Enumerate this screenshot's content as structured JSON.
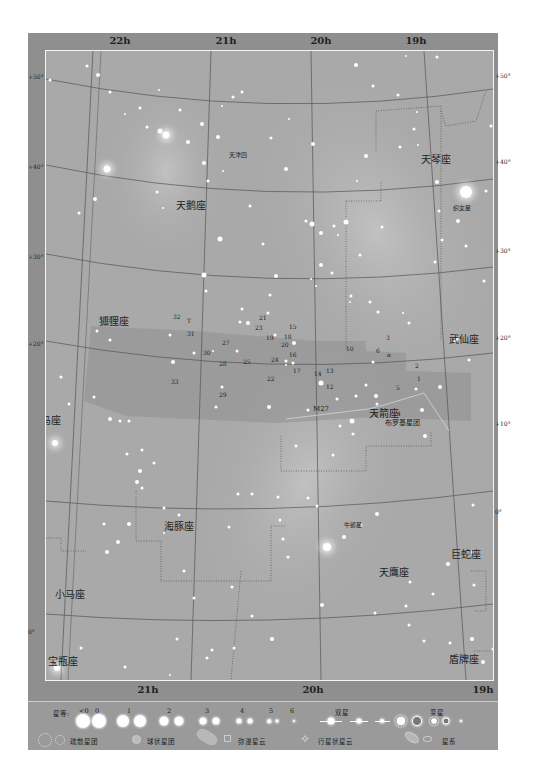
{
  "page_header": "",
  "chart": {
    "ra_labels_top": [
      {
        "label": "22h",
        "x": 92
      },
      {
        "label": "21h",
        "x": 198
      },
      {
        "label": "20h",
        "x": 293
      },
      {
        "label": "19h",
        "x": 388
      }
    ],
    "ra_labels_bottom": [
      {
        "label": "21h",
        "x": 120
      },
      {
        "label": "20h",
        "x": 285
      },
      {
        "label": "19h",
        "x": 455
      }
    ],
    "dec_labels_left": [
      {
        "label": "+50°",
        "y": 23
      },
      {
        "label": "+40°",
        "y": 113
      },
      {
        "label": "+30°",
        "y": 203
      },
      {
        "label": "+20°",
        "y": 290
      },
      {
        "label": "0°",
        "y": 578
      }
    ],
    "dec_labels_right": [
      {
        "label": "+50°",
        "y": 22
      },
      {
        "label": "+40°",
        "y": 108
      },
      {
        "label": "+30°",
        "y": 197
      },
      {
        "label": "+20°",
        "y": 284
      },
      {
        "label": "+10°",
        "y": 370
      },
      {
        "label": "0°",
        "y": 458
      }
    ],
    "constellations": [
      {
        "name": "蝎虎座",
        "x": 4,
        "y": 58
      },
      {
        "name": "天龙座",
        "x": 370,
        "y": 26
      },
      {
        "name": "武仙座",
        "x": 448,
        "y": 33
      },
      {
        "name": "天琴座",
        "x": 420,
        "y": 150
      },
      {
        "name": "天鹅座",
        "x": 175,
        "y": 196
      },
      {
        "name": "狐狸座",
        "x": 98,
        "y": 312
      },
      {
        "name": "武仙座",
        "x": 448,
        "y": 330
      },
      {
        "name": "飞马座",
        "x": 30,
        "y": 411
      },
      {
        "name": "天箭座",
        "x": 368,
        "y": 404
      },
      {
        "name": "海豚座",
        "x": 163,
        "y": 517
      },
      {
        "name": "天鹰座",
        "x": 378,
        "y": 563
      },
      {
        "name": "巨蛇座",
        "x": 450,
        "y": 545
      },
      {
        "name": "小马座",
        "x": 54,
        "y": 585
      },
      {
        "name": "宝瓶座",
        "x": 47,
        "y": 652
      },
      {
        "name": "盾牌座",
        "x": 448,
        "y": 650
      }
    ],
    "star_names": [
      {
        "name": "天津四",
        "x": 228,
        "y": 152
      },
      {
        "name": "织女星",
        "x": 452,
        "y": 205
      },
      {
        "name": "牛郎星",
        "x": 343,
        "y": 522
      }
    ],
    "cluster_label": {
      "name": "布罗基星团",
      "x": 356,
      "y": 388
    },
    "m27_label": {
      "name": "M27",
      "x": 284,
      "y": 376
    },
    "numbers": [
      {
        "n": "35",
        "x": 102,
        "y": 318
      },
      {
        "n": "32",
        "x": 172,
        "y": 315
      },
      {
        "n": "T",
        "x": 186,
        "y": 319
      },
      {
        "n": "31",
        "x": 186,
        "y": 332
      },
      {
        "n": "27",
        "x": 221,
        "y": 341
      },
      {
        "n": "30",
        "x": 202,
        "y": 351
      },
      {
        "n": "28",
        "x": 218,
        "y": 362
      },
      {
        "n": "33",
        "x": 170,
        "y": 380
      },
      {
        "n": "29",
        "x": 218,
        "y": 393
      },
      {
        "n": "21",
        "x": 258,
        "y": 316
      },
      {
        "n": "23",
        "x": 254,
        "y": 326
      },
      {
        "n": "15",
        "x": 288,
        "y": 325
      },
      {
        "n": "19",
        "x": 265,
        "y": 336
      },
      {
        "n": "18",
        "x": 283,
        "y": 335
      },
      {
        "n": "20",
        "x": 280,
        "y": 343
      },
      {
        "n": "16",
        "x": 288,
        "y": 353
      },
      {
        "n": "24",
        "x": 270,
        "y": 358
      },
      {
        "n": "25",
        "x": 242,
        "y": 360
      },
      {
        "n": "17",
        "x": 292,
        "y": 369
      },
      {
        "n": "22",
        "x": 266,
        "y": 377
      },
      {
        "n": "14",
        "x": 313,
        "y": 372
      },
      {
        "n": "13",
        "x": 325,
        "y": 369
      },
      {
        "n": "12",
        "x": 325,
        "y": 385
      },
      {
        "n": "10",
        "x": 345,
        "y": 347
      },
      {
        "n": "3",
        "x": 385,
        "y": 336
      },
      {
        "n": "6",
        "x": 375,
        "y": 349
      },
      {
        "n": "α",
        "x": 386,
        "y": 353
      },
      {
        "n": "2",
        "x": 414,
        "y": 364
      },
      {
        "n": "1",
        "x": 416,
        "y": 377
      },
      {
        "n": "5",
        "x": 395,
        "y": 386
      },
      {
        "n": "4",
        "x": 396,
        "y": 412
      },
      {
        "n": "9",
        "x": 373,
        "y": 413
      }
    ]
  },
  "legend": {
    "magnitude_label": "星等:",
    "magnitudes": [
      "<0",
      "0",
      "1",
      "2",
      "3",
      "4",
      "5",
      "6"
    ],
    "double_star_label": "双星",
    "variable_star_label": "变星",
    "open_cluster_label": "疏散星团",
    "globular_cluster_label": "球状星团",
    "diffuse_nebula_label": "弥漫星云",
    "planetary_nebula_label": "行星状星云",
    "galaxy_label": "星系"
  }
}
